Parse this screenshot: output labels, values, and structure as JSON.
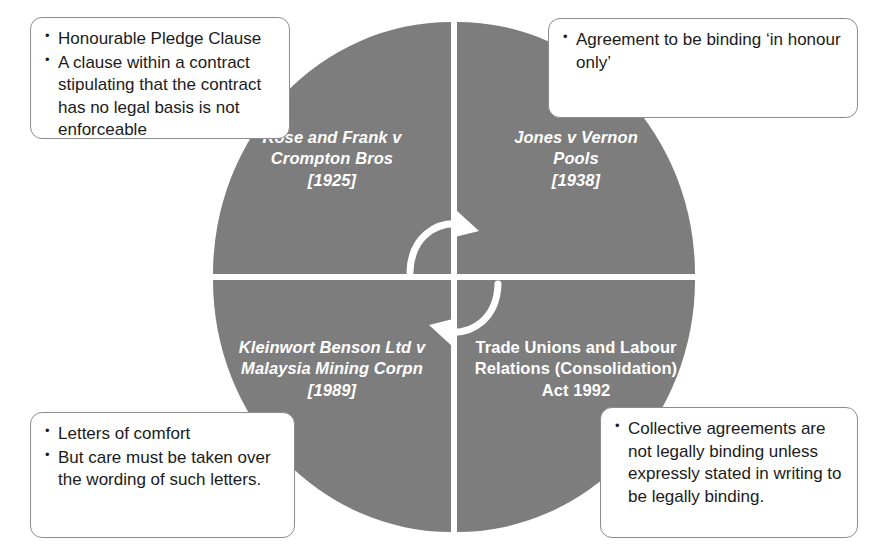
{
  "diagram": {
    "circle_color": "#7d7d7d",
    "text_color": "#ffffff",
    "box_border_color": "#8c8c8c"
  },
  "quadrants": [
    {
      "id": "top-left",
      "lines": [
        "Rose and Frank v",
        "Crompton Bros",
        "[1925]"
      ],
      "style": "italic"
    },
    {
      "id": "top-right",
      "lines": [
        "Jones v Vernon",
        "Pools",
        "[1938]"
      ],
      "style": "italic"
    },
    {
      "id": "bottom-left",
      "lines": [
        "Kleinwort Benson Ltd v",
        "Malaysia Mining Corpn",
        "[1989]"
      ],
      "style": "italic"
    },
    {
      "id": "bottom-right",
      "lines": [
        "Trade Unions and Labour",
        "Relations (Consolidation)",
        "Act 1992"
      ],
      "style": "bold"
    }
  ],
  "callouts": {
    "top_left": {
      "items": [
        "Honourable Pledge Clause",
        "A clause within a contract stipulating that the contract has no legal basis is not enforceable"
      ]
    },
    "top_right": {
      "items": [
        "Agreement to be binding ‘in honour only’"
      ]
    },
    "bottom_left": {
      "items": [
        "Letters of comfort",
        "But care must be taken over the wording of such letters."
      ]
    },
    "bottom_right": {
      "items": [
        "Collective agreements are not legally binding unless expressly stated in writing to be legally binding."
      ]
    }
  },
  "arrows": {
    "top_arrow_label": "clockwise-arrow-top",
    "bottom_arrow_label": "counterclockwise-arrow-bottom"
  }
}
